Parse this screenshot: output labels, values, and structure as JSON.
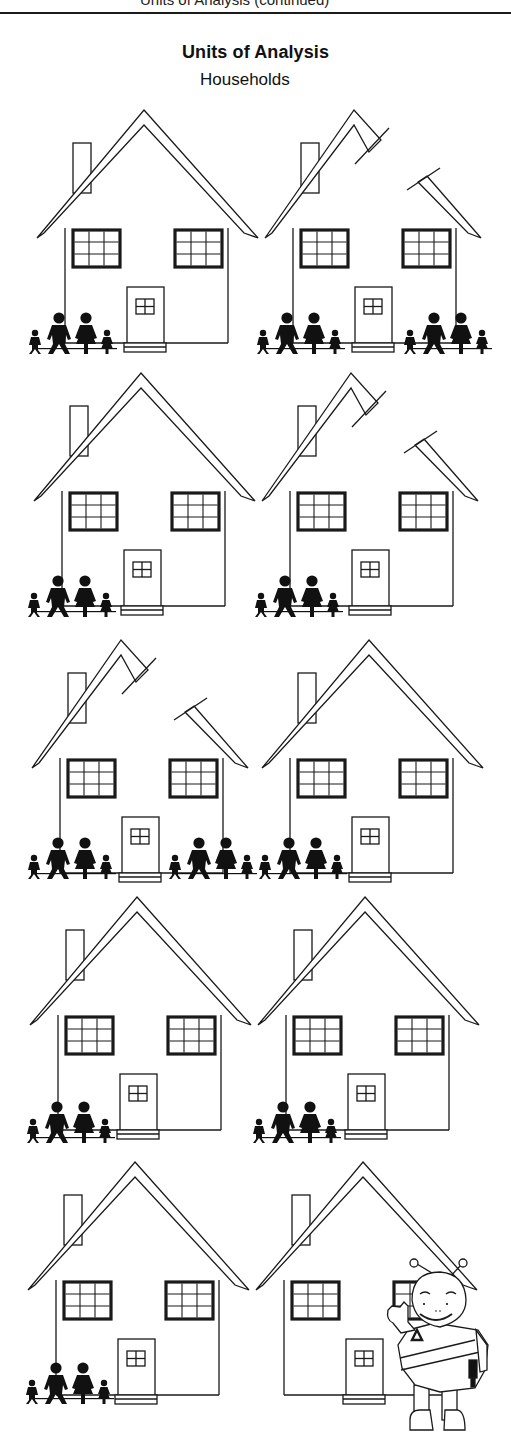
{
  "header": {
    "cut_off_line": "Units of Analysis (continued)",
    "title": "Units of Analysis",
    "subtitle": "Households"
  },
  "figure": {
    "rows": [
      {
        "row": 1,
        "houses": [
          {
            "position": "left",
            "roof": "whole",
            "families": 1
          },
          {
            "position": "right",
            "roof": "split",
            "families": 2
          }
        ]
      },
      {
        "row": 2,
        "houses": [
          {
            "position": "left",
            "roof": "whole",
            "families": 1
          },
          {
            "position": "right",
            "roof": "split",
            "families": 1
          }
        ]
      },
      {
        "row": 3,
        "houses": [
          {
            "position": "left",
            "roof": "split",
            "families": 2
          },
          {
            "position": "right",
            "roof": "whole",
            "families": 1
          }
        ]
      },
      {
        "row": 4,
        "houses": [
          {
            "position": "left",
            "roof": "whole",
            "families": 1
          },
          {
            "position": "right",
            "roof": "whole",
            "families": 1
          }
        ]
      },
      {
        "row": 5,
        "houses": [
          {
            "position": "left",
            "roof": "whole",
            "families": 1
          },
          {
            "position": "right",
            "roof": "whole",
            "families": 0,
            "mascot": true
          }
        ]
      }
    ],
    "family_members": [
      "boy",
      "father",
      "mother",
      "girl"
    ],
    "mascot": {
      "name": "waving-mascot",
      "badge_symbol": "triangle"
    }
  },
  "colors": {
    "ink": "#1a1a1a",
    "paper": "#ffffff"
  }
}
